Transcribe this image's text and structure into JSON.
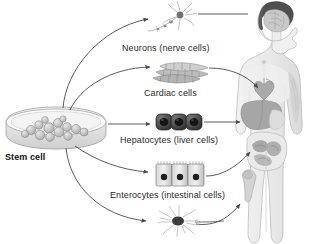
{
  "figure": {
    "title_text": "Stem cell differentiation diagram",
    "background": "#ffffff",
    "line_color": "#4a4a4a",
    "text_color": "#2b2b2b"
  },
  "source": {
    "label": "Stem cell",
    "icon": "petri-dish-icon",
    "description": "Petri dish containing cluster of stem cells"
  },
  "lineages": [
    {
      "id": "neurons",
      "label": "Neurons (nerve cells)",
      "icon": "neuron-cell-icon",
      "target_organ": "brain"
    },
    {
      "id": "cardiac",
      "label": "Cardiac cells",
      "icon": "cardiac-muscle-fiber-icon",
      "target_organ": "heart"
    },
    {
      "id": "hepatocytes",
      "label": "Hepatocytes (liver cells)",
      "icon": "hepatocyte-cell-icon",
      "target_organ": "liver"
    },
    {
      "id": "enterocytes",
      "label": "Enterocytes (intestinal cells)",
      "icon": "enterocyte-columnar-cell-icon",
      "target_organ": "intestines"
    },
    {
      "id": "osteocytes",
      "label": "",
      "icon": "stellate-cell-icon",
      "target_organ": "bone"
    }
  ],
  "body": {
    "icon": "human-body-figure-icon",
    "description": "Human figure in profile with brain, heart, liver, intestines and bone highlighted"
  }
}
